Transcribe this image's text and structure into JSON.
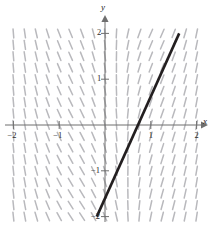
{
  "figure": {
    "type": "slope-field-with-solution-curve",
    "background_color": "#ffffff",
    "axis_color": "#6f6f6f",
    "slope_mark_color": "#b9b9bd",
    "solution_line_color": "#231f20"
  },
  "axes": {
    "x_label": "x",
    "y_label": "y",
    "x_ticks": [
      {
        "value": -2,
        "label": "−2",
        "px": 12
      },
      {
        "value": -1,
        "label": "−1",
        "px": 58
      },
      {
        "value": 1,
        "label": "1",
        "px": 150
      },
      {
        "value": 2,
        "label": "2",
        "px": 196
      }
    ],
    "y_ticks": [
      {
        "value": 2,
        "label": "2",
        "px": 31
      },
      {
        "value": 1,
        "label": "1",
        "px": 80
      },
      {
        "value": -1,
        "label": "−1",
        "px": 171
      },
      {
        "value": -2,
        "label": "−2",
        "px": 217
      }
    ],
    "origin_px": {
      "x": 105,
      "y": 125
    },
    "unit_px": 45.8,
    "x_range": [
      -2.25,
      2.25
    ],
    "y_range": [
      -2.25,
      2.25
    ]
  },
  "chart_data": {
    "type": "line",
    "title": "",
    "xlabel": "x",
    "ylabel": "y",
    "xlim": [
      -2,
      2
    ],
    "ylim": [
      -2,
      2
    ],
    "grid": false,
    "legend": "none",
    "series": [
      {
        "name": "solution curve",
        "color": "#231f20",
        "x": [
          -0.18,
          1.62
        ],
        "y": [
          -2.0,
          2.0
        ],
        "x_intercept": 1.0,
        "slope": 2.22
      }
    ],
    "slope_field": {
      "description": "short gray tick segments on a grid; nearly vertical near x = -2 and x = 2, tilted through the middle",
      "x_samples": [
        -2.0,
        -1.75,
        -1.5,
        -1.25,
        -1.0,
        -0.75,
        -0.5,
        -0.25,
        0.0,
        0.25,
        0.5,
        0.75,
        1.0,
        1.25,
        1.5,
        1.75,
        2.0
      ],
      "y_samples": [
        -2.0,
        -1.75,
        -1.5,
        -1.25,
        -1.0,
        -0.75,
        -0.5,
        -0.25,
        0.0,
        0.25,
        0.5,
        0.75,
        1.0,
        1.25,
        1.5,
        1.75,
        2.0
      ],
      "mark_length_px": 9
    }
  }
}
